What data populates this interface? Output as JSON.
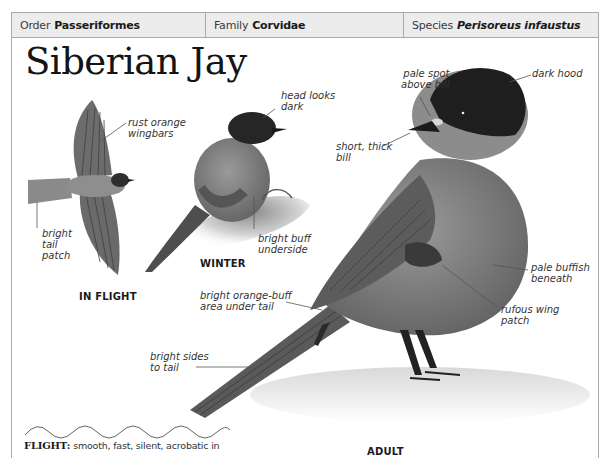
{
  "taxonomy": {
    "order": {
      "label": "Order",
      "value": "Passeriformes"
    },
    "family": {
      "label": "Family",
      "value": "Corvidae"
    },
    "species": {
      "label": "Species",
      "value": "Perisoreus infaustus"
    }
  },
  "title": "Siberian Jay",
  "figures": {
    "in_flight": {
      "caption": "IN FLIGHT",
      "annotations": {
        "wingbars": "rust orange\nwingbars",
        "tail": "bright\ntail\npatch"
      }
    },
    "winter": {
      "caption": "WINTER",
      "annotations": {
        "head": "head looks\ndark",
        "underside": "bright buff\nunderside"
      }
    },
    "adult": {
      "caption": "ADULT",
      "annotations": {
        "pale_spot": "pale spot\nabove bill",
        "dark_hood": "dark hood",
        "bill": "short, thick\nbill",
        "undertail": "bright orange-buff\narea under tail",
        "pale_beneath": "pale buffish\nbeneath",
        "wing_patch": "rufous wing\npatch",
        "tail_sides": "bright sides\nto tail"
      }
    }
  },
  "flight": {
    "label": "FLIGHT:",
    "description": "smooth, fast, silent, acrobatic in"
  },
  "colors": {
    "header_bg": "#ececec",
    "border": "#a9a9a9"
  }
}
